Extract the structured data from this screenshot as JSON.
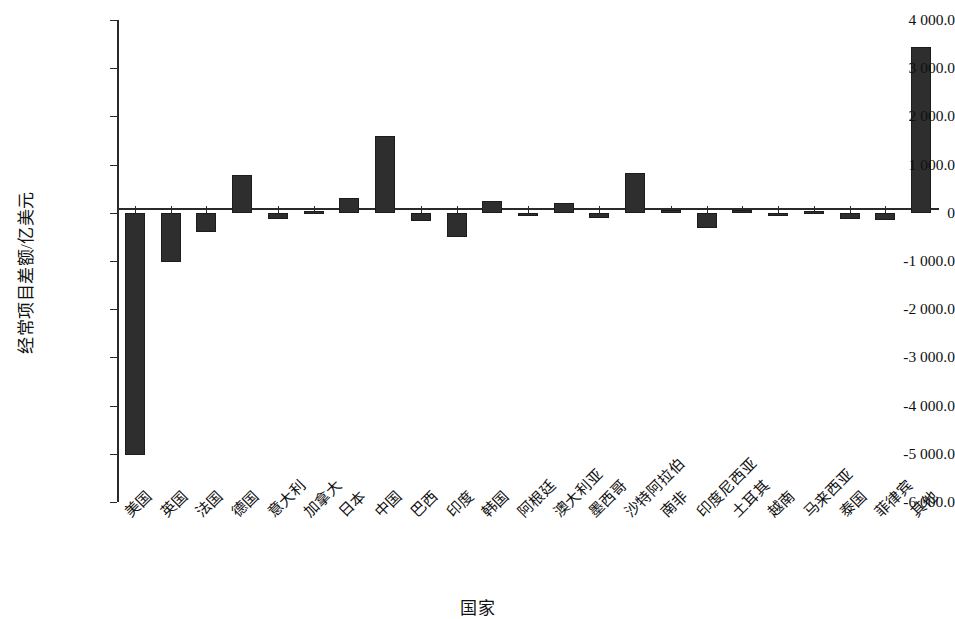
{
  "chart_data": {
    "type": "bar",
    "title": "",
    "xlabel": "国家",
    "ylabel": "经常项目差额/亿美元",
    "ylim": [
      -6000,
      4000
    ],
    "ytick_step": 1000,
    "grid": false,
    "legend": null,
    "bar_color": "#2e2e2e",
    "ytick_labels": [
      "4 000.0",
      "3 000.0",
      "2 000.0",
      "1 000.0",
      "0",
      "-1 000.0",
      "-2 000.0",
      "-3 000.0",
      "-4 000.0",
      "-5 000.0",
      "-6 000.0"
    ],
    "ytick_values": [
      4000,
      3000,
      2000,
      1000,
      0,
      -1000,
      -2000,
      -3000,
      -4000,
      -5000,
      -6000
    ],
    "categories": [
      "美国",
      "英国",
      "法国",
      "德国",
      "意大利",
      "加拿大",
      "日本",
      "中国",
      "巴西",
      "印度",
      "韩国",
      "阿根廷",
      "澳大利亚",
      "墨西哥",
      "沙特阿拉伯",
      "南非",
      "印度尼西亚",
      "土耳其",
      "越南",
      "马来西亚",
      "泰国",
      "菲律宾",
      "其他"
    ],
    "values": [
      -5020,
      -1020,
      -390,
      780,
      -120,
      40,
      310,
      1600,
      -180,
      -510,
      250,
      -50,
      200,
      -110,
      820,
      50,
      -310,
      60,
      -60,
      40,
      -130,
      -150,
      3430
    ]
  }
}
